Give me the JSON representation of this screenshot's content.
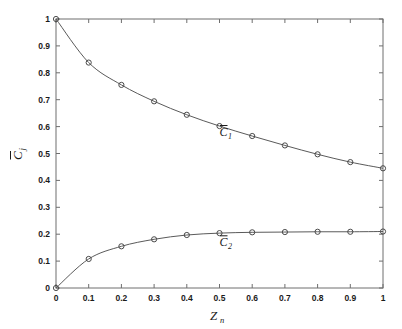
{
  "chart_data": {
    "type": "scatter",
    "title": "",
    "subtitle": "",
    "xlabel": "Z",
    "xlabel_sub": "n",
    "ylabel": "C",
    "ylabel_sub": "j",
    "ylabel_overbar": true,
    "xlim": [
      0,
      1
    ],
    "ylim": [
      0,
      1
    ],
    "grid": false,
    "legend_position": "inline-annotation",
    "x_ticks": [
      0,
      0.1,
      0.2,
      0.3,
      0.4,
      0.5,
      0.6,
      0.7,
      0.8,
      0.9,
      1
    ],
    "x_tick_labels": [
      "0",
      "0.1",
      "0.2",
      "0.3",
      "0.4",
      "0.5",
      "0.6",
      "0.7",
      "0.8",
      "0.9",
      "1"
    ],
    "y_ticks": [
      0,
      0.1,
      0.2,
      0.3,
      0.4,
      0.5,
      0.6,
      0.7,
      0.8,
      0.9,
      1
    ],
    "y_tick_labels": [
      "0",
      "0.1",
      "0.2",
      "0.3",
      "0.4",
      "0.5",
      "0.6",
      "0.7",
      "0.8",
      "0.9",
      "1"
    ],
    "x": [
      0,
      0.1,
      0.2,
      0.3,
      0.4,
      0.5,
      0.6,
      0.7,
      0.8,
      0.9,
      1
    ],
    "series": [
      {
        "name": "C1",
        "label": "C",
        "label_sub": "1",
        "label_overbar": true,
        "marker": "open-circle",
        "values": [
          1.0,
          0.838,
          0.755,
          0.694,
          0.644,
          0.602,
          0.565,
          0.53,
          0.497,
          0.468,
          0.445
        ],
        "fit_line": true,
        "annotation_x": 0.5,
        "annotation_y": 0.565
      },
      {
        "name": "C2",
        "label": "C",
        "label_sub": "2",
        "label_overbar": true,
        "marker": "open-circle",
        "values": [
          0.0,
          0.108,
          0.155,
          0.181,
          0.197,
          0.204,
          0.207,
          0.208,
          0.209,
          0.209,
          0.21
        ],
        "fit_line": true,
        "annotation_x": 0.5,
        "annotation_y": 0.155
      }
    ]
  }
}
